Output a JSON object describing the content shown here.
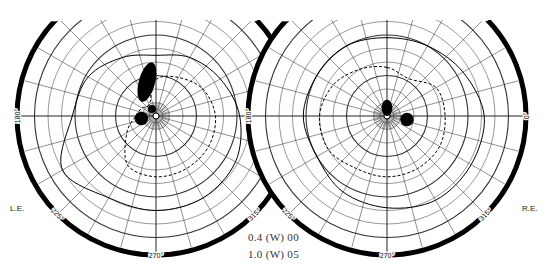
{
  "chart_data": {
    "type": "polar-visual-field",
    "charts": [
      {
        "eye": "left",
        "label": "L.E.",
        "center": [
          156,
          116
        ],
        "outer_radius": 139,
        "meridian_labels": [
          "135°",
          "45°",
          "180°",
          "0°",
          "225°",
          "315°",
          "270°"
        ],
        "radial_labels": [
          "20°",
          "40°",
          "60°",
          "80°",
          "90°"
        ],
        "isopters": [
          {
            "stimulus": "I4e",
            "style": "solid",
            "points_deg": [
              [
                90,
                45
              ],
              [
                60,
                50
              ],
              [
                30,
                55
              ],
              [
                0,
                62
              ],
              [
                330,
                68
              ],
              [
                300,
                70
              ],
              [
                270,
                70
              ],
              [
                240,
                70
              ],
              [
                210,
                80
              ],
              [
                180,
                62
              ],
              [
                150,
                58
              ],
              [
                120,
                50
              ]
            ]
          },
          {
            "stimulus": "I2e",
            "style": "dashed",
            "points_deg": [
              [
                90,
                27
              ],
              [
                60,
                33
              ],
              [
                30,
                40
              ],
              [
                0,
                44
              ],
              [
                330,
                45
              ],
              [
                300,
                45
              ],
              [
                270,
                45
              ],
              [
                240,
                42
              ],
              [
                210,
                25
              ],
              [
                180,
                15
              ],
              [
                150,
                12
              ],
              [
                120,
                10
              ]
            ]
          }
        ],
        "scotomas": [
          {
            "type": "absolute",
            "center_deg": [
              105,
              26
            ],
            "size_deg": [
              6,
              15
            ]
          },
          {
            "type": "absolute",
            "center_deg": [
              190,
              11
            ],
            "size_deg": [
              5,
              5
            ]
          },
          {
            "type": "absolute",
            "center_deg": [
              120,
              6
            ],
            "size_deg": [
              3,
              3
            ]
          }
        ]
      },
      {
        "eye": "right",
        "label": "R.E.",
        "center": [
          387,
          116
        ],
        "outer_radius": 139,
        "meridian_labels": [
          "135°",
          "45°",
          "180°",
          "0°",
          "225°",
          "315°",
          "270°"
        ],
        "radial_labels": [
          "20°",
          "40°",
          "60°",
          "80°",
          "90°"
        ],
        "isopters": [
          {
            "stimulus": "I4e",
            "style": "solid",
            "points_deg": [
              [
                90,
                58
              ],
              [
                60,
                60
              ],
              [
                30,
                65
              ],
              [
                0,
                72
              ],
              [
                330,
                72
              ],
              [
                300,
                72
              ],
              [
                270,
                68
              ],
              [
                240,
                65
              ],
              [
                210,
                60
              ],
              [
                180,
                62
              ],
              [
                150,
                60
              ],
              [
                120,
                60
              ]
            ]
          },
          {
            "stimulus": "I2e",
            "style": "dashed",
            "points_deg": [
              [
                90,
                36
              ],
              [
                60,
                32
              ],
              [
                30,
                42
              ],
              [
                0,
                43
              ],
              [
                330,
                45
              ],
              [
                300,
                45
              ],
              [
                270,
                45
              ],
              [
                240,
                45
              ],
              [
                210,
                50
              ],
              [
                180,
                50
              ],
              [
                150,
                46
              ],
              [
                120,
                40
              ]
            ]
          }
        ],
        "scotomas": [
          {
            "type": "absolute",
            "center_deg": [
              90,
              6
            ],
            "size_deg": [
              4,
              6
            ]
          },
          {
            "type": "absolute",
            "center_deg": [
              350,
              15
            ],
            "size_deg": [
              5,
              5
            ]
          }
        ]
      }
    ],
    "legend": [
      {
        "text": "0.4 (W) 00",
        "style": "dashed"
      },
      {
        "text": "1.0 (W) 05",
        "style": "solid"
      }
    ]
  },
  "labels": {
    "left_eye": "L.E.",
    "right_eye": "R.E.",
    "legend_0": "0.4 (W) 00",
    "legend_1": "1.0 (W) 05"
  }
}
